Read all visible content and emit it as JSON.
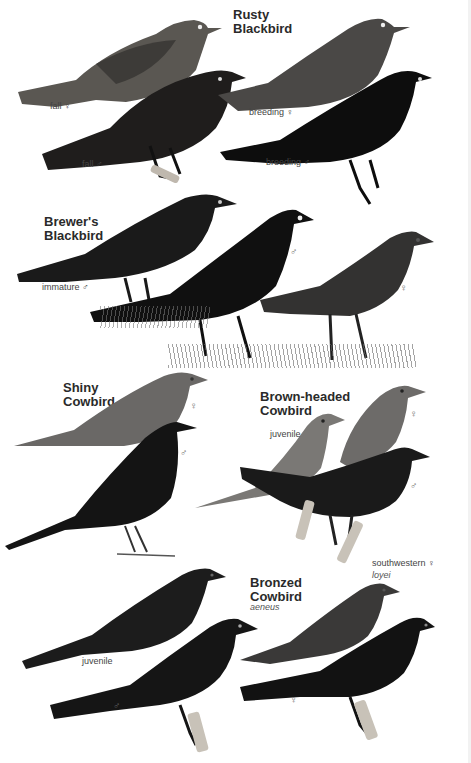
{
  "plate": {
    "background": "#ffffff",
    "species": [
      {
        "name": "Rusty\nBlackbird",
        "birds": [
          {
            "label": "fall ♀",
            "tone": "#5a5752"
          },
          {
            "label": "fall ♂",
            "tone": "#1f1d1c"
          },
          {
            "label": "breeding ♀",
            "tone": "#4a4846"
          },
          {
            "label": "breeding ♂",
            "tone": "#0d0d0d"
          }
        ]
      },
      {
        "name": "Brewer's\nBlackbird",
        "birds": [
          {
            "label": "immature ♂",
            "tone": "#1a1a1a"
          },
          {
            "label": "♂",
            "tone": "#101010"
          },
          {
            "label": "♀",
            "tone": "#333231"
          }
        ]
      },
      {
        "name": "Shiny\nCowbird",
        "birds": [
          {
            "label": "♀",
            "tone": "#6a6866"
          },
          {
            "label": "♂",
            "tone": "#141414"
          }
        ]
      },
      {
        "name": "Brown-headed\nCowbird",
        "birds": [
          {
            "label": "juvenile",
            "tone": "#7a7875"
          },
          {
            "label": "♀",
            "tone": "#6d6b69"
          },
          {
            "label": "♂",
            "tone": "#1a1a1a"
          }
        ]
      },
      {
        "name": "Bronzed\nCowbird",
        "subspecies": "aeneus",
        "birds": [
          {
            "label": "juvenile",
            "tone": "#1c1c1c"
          },
          {
            "label": "♂",
            "tone": "#151515"
          },
          {
            "label": "southwestern ♀",
            "sublabel": "loyei",
            "tone": "#3a3938"
          },
          {
            "label": "♀",
            "tone": "#121212"
          }
        ]
      }
    ]
  }
}
